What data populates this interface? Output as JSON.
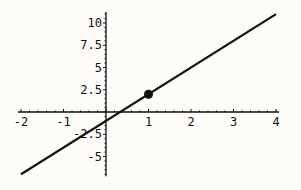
{
  "chart_data": {
    "type": "line",
    "title": "",
    "xlabel": "",
    "ylabel": "",
    "xlim": [
      -2,
      4
    ],
    "ylim": [
      -7,
      11
    ],
    "grid": false,
    "series": [
      {
        "name": "line",
        "x": [
          -2,
          4
        ],
        "y": [
          -7,
          11
        ],
        "equation": "y = 3x - 1"
      }
    ],
    "points": [
      {
        "x": 1,
        "y": 2
      }
    ],
    "x_ticks": [
      {
        "value": -2,
        "label": "-2"
      },
      {
        "value": -1,
        "label": "-1"
      },
      {
        "value": 1,
        "label": "1"
      },
      {
        "value": 2,
        "label": "2"
      },
      {
        "value": 3,
        "label": "3"
      },
      {
        "value": 4,
        "label": "4"
      }
    ],
    "y_ticks": [
      {
        "value": 10,
        "label": "10"
      },
      {
        "value": 7.5,
        "label": "7.5"
      },
      {
        "value": 5,
        "label": "5"
      },
      {
        "value": 2.5,
        "label": "2.5"
      },
      {
        "value": -2.5,
        "label": "-2.5"
      },
      {
        "value": -5,
        "label": "-5"
      }
    ]
  }
}
